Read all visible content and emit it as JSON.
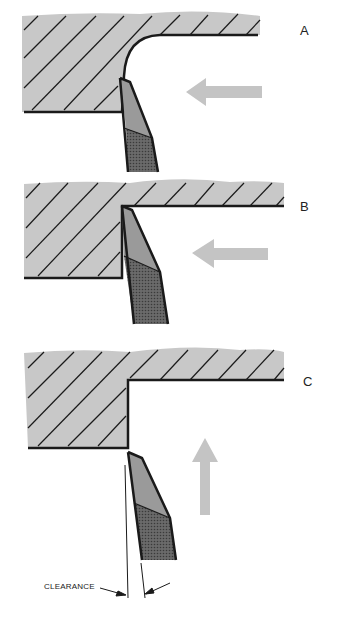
{
  "figure": {
    "panels": [
      {
        "id": "A",
        "label": "A",
        "feed_direction": "left",
        "corner": "radius"
      },
      {
        "id": "B",
        "label": "B",
        "feed_direction": "left",
        "corner": "sharp"
      },
      {
        "id": "C",
        "label": "C",
        "feed_direction": "up",
        "corner": "sharp"
      }
    ],
    "annotation": {
      "clearance_label": "CLEARANCE"
    },
    "colors": {
      "workpiece": "#c8c8c8",
      "hatch": "#1a1a1a",
      "tool_face": "#9a9a9a",
      "tool_shank": "#5a5a5a",
      "arrow": "#c4c4c4",
      "outline": "#1a1a1a"
    }
  }
}
